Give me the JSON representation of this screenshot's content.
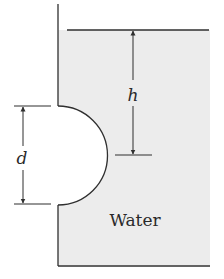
{
  "diagram": {
    "type": "hydrostatics-tank-with-hemispherical-bulge",
    "labels": {
      "depth": "h",
      "diameter": "d",
      "fluid": "Water"
    },
    "colors": {
      "line": "#2f2f2f",
      "water_fill": "#ececec",
      "background": "#ffffff"
    }
  }
}
